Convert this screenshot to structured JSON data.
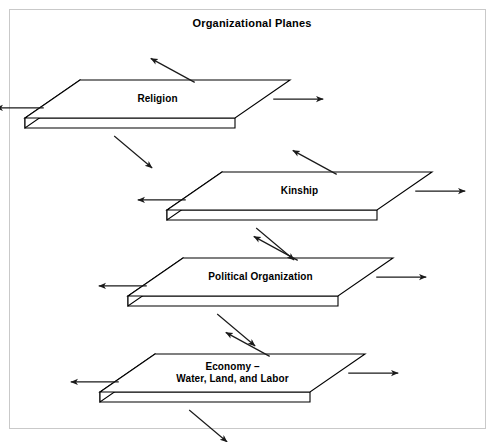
{
  "figure": {
    "title": "Organizational Planes",
    "border_color": "#c9c9c9",
    "background_color": "#ffffff",
    "stroke_color": "#000000",
    "face_fill": "#ffffff"
  },
  "diagram": {
    "type": "layered-planes",
    "planes": [
      {
        "id": "religion",
        "label": "Religion",
        "label_lines": [
          "Religion"
        ],
        "order": 1,
        "origin_x": 80,
        "origin_y": 80,
        "arrows": [
          "up-left",
          "left",
          "right",
          "down-right"
        ]
      },
      {
        "id": "kinship",
        "label": "Kinship",
        "label_lines": [
          "Kinship"
        ],
        "order": 2,
        "origin_x": 222,
        "origin_y": 172,
        "arrows": [
          "up-left",
          "left",
          "right",
          "down-right"
        ]
      },
      {
        "id": "political-organization",
        "label": "Political Organization",
        "label_lines": [
          "Political Organization"
        ],
        "order": 3,
        "origin_x": 183,
        "origin_y": 258,
        "arrows": [
          "up-left",
          "left",
          "right",
          "down-right"
        ]
      },
      {
        "id": "economy",
        "label": "Economy – Water, Land, and Labor",
        "label_lines": [
          "Economy –",
          "Water, Land, and Labor"
        ],
        "order": 4,
        "origin_x": 155,
        "origin_y": 354,
        "arrows": [
          "up-left",
          "left",
          "right",
          "down-right"
        ]
      }
    ],
    "geometry": {
      "top_width": 210,
      "depth_x": -55,
      "depth_y": 38,
      "thickness": 10
    }
  }
}
